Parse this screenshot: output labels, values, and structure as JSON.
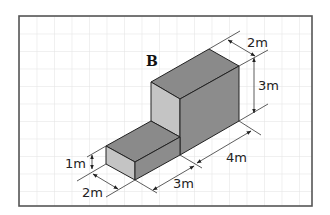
{
  "diagram": {
    "title": "B",
    "shape": "L-shaped stepped block (isometric)",
    "colors": {
      "frame": "#555555",
      "grid": "#e2e2e2",
      "top_face": "#8a8a8a",
      "front_face": "#c4c4c4",
      "side_face": "#8c8c8c",
      "edge": "#222222",
      "dimension_line": "#333333"
    },
    "dimensions": {
      "tall_depth": "2m",
      "tall_height": "3m",
      "tall_length": "4m",
      "low_length": "3m",
      "low_height": "1m",
      "low_depth": "2m"
    }
  }
}
